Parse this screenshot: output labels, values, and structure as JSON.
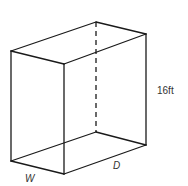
{
  "diagram": {
    "type": "rectangular-prism",
    "labels": {
      "height": "16ft",
      "width": "W",
      "depth": "D"
    },
    "colors": {
      "line": "#1a1a1a",
      "text": "#333333",
      "background": "#ffffff"
    }
  }
}
